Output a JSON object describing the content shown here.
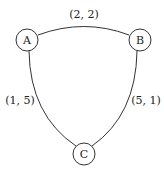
{
  "nodes": [
    {
      "id": "A",
      "label": "A"
    },
    {
      "id": "B",
      "label": "B"
    },
    {
      "id": "C",
      "label": "C"
    }
  ],
  "edges": [
    {
      "from": "A",
      "to": "B",
      "label": "(2, 2)"
    },
    {
      "from": "A",
      "to": "C",
      "label": "(1, 5)"
    },
    {
      "from": "B",
      "to": "C",
      "label": "(5, 1)"
    }
  ],
  "colors": {
    "stroke": "#333333",
    "background": "#ffffff"
  }
}
